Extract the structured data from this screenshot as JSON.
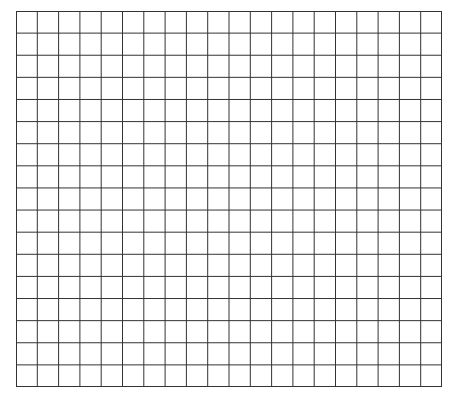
{
  "grid": {
    "columns": 20,
    "rows": 17,
    "line_color": "#333333",
    "background": "#ffffff"
  }
}
